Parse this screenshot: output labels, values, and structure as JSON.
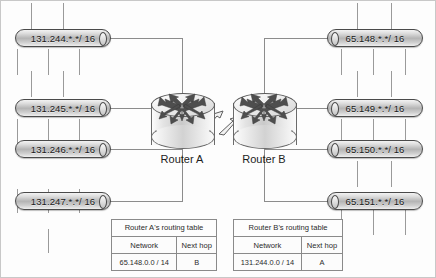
{
  "diagram": {
    "routers": [
      {
        "id": "a",
        "label": "Router A",
        "icon": "router-icon"
      },
      {
        "id": "b",
        "label": "Router B",
        "icon": "router-icon"
      }
    ],
    "link": {
      "name": "wan-serial-link",
      "style": "lightning-zigzag"
    },
    "networks_left": [
      {
        "label": "131.244.*.*/ 16"
      },
      {
        "label": "131.245.*.*/ 16"
      },
      {
        "label": "131.246.*.*/ 16"
      },
      {
        "label": "131.247.*.*/ 16"
      }
    ],
    "networks_right": [
      {
        "label": "65.148.*.*/ 16"
      },
      {
        "label": "65.149.*.*/ 16"
      },
      {
        "label": "65.150.*.*/ 16"
      },
      {
        "label": "65.151.*.*/ 16"
      }
    ],
    "tables": [
      {
        "caption": "Router A's routing table",
        "columns": [
          "Network",
          "Next hop"
        ],
        "rows": [
          [
            "65.148.0.0 / 14",
            "B"
          ]
        ]
      },
      {
        "caption": "Router B's routing table",
        "columns": [
          "Network",
          "Next hop"
        ],
        "rows": [
          [
            "131.244.0.0 / 14",
            "A"
          ]
        ]
      }
    ],
    "colors": {
      "line": "#8c8c8c",
      "outline": "#4a4a4a",
      "text": "#1c1c1c",
      "bar_fill": "#b4b4b4"
    }
  }
}
